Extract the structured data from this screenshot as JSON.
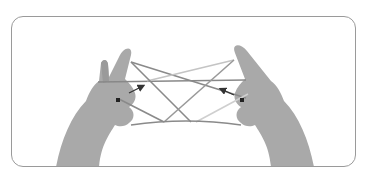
{
  "illustration": {
    "subject": "hands holding string figure (cat's cradle)",
    "colors": {
      "frame_border": "#9a9a9a",
      "skin": "#a8a8a8",
      "skin_shadow": "#8a8a8a",
      "string_dark": "#7a7a7a",
      "string_light": "#c8c8c8",
      "arrow": "#333333",
      "marker": "#222222"
    },
    "annotations": [
      {
        "type": "arrow",
        "side": "left",
        "direction": "up-right"
      },
      {
        "type": "arrow",
        "side": "right",
        "direction": "up-left"
      },
      {
        "type": "marker",
        "side": "left",
        "shape": "square"
      },
      {
        "type": "marker",
        "side": "right",
        "shape": "square"
      }
    ]
  }
}
